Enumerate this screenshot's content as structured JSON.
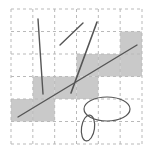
{
  "figure": {
    "canvas": {
      "width": 151,
      "height": 155,
      "background": "#ffffff"
    },
    "grid": {
      "x0": 11,
      "y0": 9,
      "x1": 142,
      "y1": 144,
      "cols": 6,
      "rows": 6,
      "line_color": "#b9b9b9",
      "dash": "3 3",
      "stroke_width": 1
    },
    "fill_color": "#c9c9c9",
    "filled_cells": [
      {
        "row": 1,
        "col": 5
      },
      {
        "row": 2,
        "col": 3
      },
      {
        "row": 2,
        "col": 4
      },
      {
        "row": 2,
        "col": 5
      },
      {
        "row": 3,
        "col": 1
      },
      {
        "row": 3,
        "col": 2
      },
      {
        "row": 3,
        "col": 3
      },
      {
        "row": 4,
        "col": 0
      },
      {
        "row": 4,
        "col": 1
      }
    ],
    "stroke_color": "#555555",
    "segments": [
      {
        "name": "segment-near-vertical",
        "x1": 38,
        "y1": 19,
        "x2": 43,
        "y2": 94,
        "width": 1.4
      },
      {
        "name": "segment-short-diagonal",
        "x1": 60,
        "y1": 45,
        "x2": 83,
        "y2": 23,
        "width": 1.4
      },
      {
        "name": "segment-steep-diagonal",
        "x1": 97,
        "y1": 22,
        "x2": 71,
        "y2": 93,
        "width": 1.6
      },
      {
        "name": "segment-long-shallow-diagonal",
        "x1": 18,
        "y1": 117,
        "x2": 137,
        "y2": 45,
        "width": 1.4
      }
    ],
    "ellipses": [
      {
        "name": "ellipse-large",
        "cx": 107,
        "cy": 109,
        "rx": 23,
        "ry": 12,
        "rotation": 0,
        "width": 1.2
      },
      {
        "name": "ellipse-small",
        "cx": 88,
        "cy": 128,
        "rx": 6.5,
        "ry": 13,
        "rotation": 8,
        "width": 1.2
      }
    ]
  }
}
